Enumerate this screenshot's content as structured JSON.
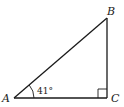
{
  "diagram": {
    "type": "right-triangle",
    "vertices": {
      "A": {
        "label": "A"
      },
      "B": {
        "label": "B"
      },
      "C": {
        "label": "C"
      }
    },
    "angle_A": {
      "label": "41°",
      "value_deg": 41
    },
    "right_angle_at": "C",
    "colors": {
      "stroke": "#1a1a1a",
      "background": "#ffffff"
    }
  }
}
